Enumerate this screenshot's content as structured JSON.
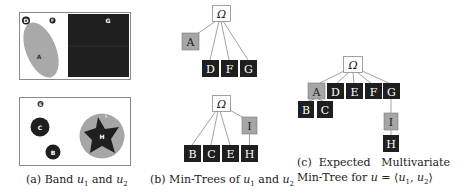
{
  "colors": {
    "dark": "#1f1f1f",
    "gray": "#a6a6a6",
    "light_gray": "#b3b3b3",
    "white": "#ffffff",
    "border": "#7a7a7a",
    "edge": "#8a8a8a"
  },
  "panel_a": {
    "caption_prefix": "(a) Band ",
    "caption_var1": "u",
    "caption_sub1": "1",
    "caption_mid": " and ",
    "caption_var2": "u",
    "caption_sub2": "2",
    "band_u1": {
      "regions": [
        {
          "label": "D",
          "shape": "circle",
          "fill": "dark"
        },
        {
          "label": "F",
          "shape": "circle",
          "fill": "dark"
        },
        {
          "label": "A",
          "shape": "ellipse",
          "fill": "gray"
        },
        {
          "label": "G",
          "shape": "rectangle",
          "fill": "dark"
        }
      ]
    },
    "band_u2": {
      "regions": [
        {
          "label": "E",
          "shape": "circle",
          "fill": "dark"
        },
        {
          "label": "C",
          "shape": "circle",
          "fill": "dark"
        },
        {
          "label": "B",
          "shape": "circle",
          "fill": "dark"
        },
        {
          "label": "I",
          "shape": "circle",
          "fill": "gray"
        },
        {
          "label": "H",
          "shape": "star",
          "fill": "dark"
        }
      ]
    }
  },
  "panel_b": {
    "caption_prefix": "(b) Min-Trees of ",
    "caption_var1": "u",
    "caption_sub1": "1",
    "caption_mid": " and ",
    "caption_var2": "u",
    "caption_sub2": "2",
    "tree_u1": {
      "root": "Ω",
      "nodes": [
        {
          "label": "A",
          "parent": "Ω",
          "fill": "gray"
        },
        {
          "label": "D",
          "parent": "Ω",
          "fill": "dark"
        },
        {
          "label": "F",
          "parent": "Ω",
          "fill": "dark"
        },
        {
          "label": "G",
          "parent": "Ω",
          "fill": "dark"
        }
      ]
    },
    "tree_u2": {
      "root": "Ω",
      "nodes": [
        {
          "label": "B",
          "parent": "Ω",
          "fill": "dark"
        },
        {
          "label": "C",
          "parent": "Ω",
          "fill": "dark"
        },
        {
          "label": "E",
          "parent": "Ω",
          "fill": "dark"
        },
        {
          "label": "I",
          "parent": "Ω",
          "fill": "gray"
        },
        {
          "label": "H",
          "parent": "I",
          "fill": "dark"
        }
      ]
    }
  },
  "panel_c": {
    "caption_line1": "(c)  Expected   Multivariate",
    "caption_line2_prefix": "Min-Tree for ",
    "caption_var": "u",
    "caption_eq": " = ⟨",
    "caption_var1": "u",
    "caption_sub1": "1",
    "caption_comma": ", ",
    "caption_var2": "u",
    "caption_sub2": "2",
    "caption_close": "⟩",
    "tree": {
      "root": "Ω",
      "nodes": [
        {
          "label": "A",
          "parent": "Ω",
          "fill": "gray"
        },
        {
          "label": "D",
          "parent": "Ω",
          "fill": "dark"
        },
        {
          "label": "E",
          "parent": "Ω",
          "fill": "dark"
        },
        {
          "label": "F",
          "parent": "Ω",
          "fill": "dark"
        },
        {
          "label": "G",
          "parent": "Ω",
          "fill": "dark"
        },
        {
          "label": "B",
          "parent": "A",
          "fill": "dark"
        },
        {
          "label": "C",
          "parent": "A",
          "fill": "dark"
        },
        {
          "label": "I",
          "parent": "G",
          "fill": "gray"
        },
        {
          "label": "H",
          "parent": "I",
          "fill": "dark"
        }
      ]
    }
  }
}
